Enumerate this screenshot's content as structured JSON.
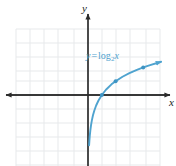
{
  "figure": {
    "width": 176,
    "height": 166,
    "background": "#ffffff",
    "y_axis_label": "y",
    "x_axis_label": "x",
    "equation": {
      "lhs": "y",
      "operator": "=",
      "function": "log",
      "base": "2",
      "argument": "x",
      "full_text": "y = log₂ x",
      "color": "#4fa3cf"
    }
  },
  "chart_data": {
    "type": "line",
    "title": "",
    "subtitle": "",
    "xlabel": "x",
    "ylabel": "y",
    "function": "y = log_2(x)",
    "annotations": [
      {
        "text": "y = log₂ x",
        "x": 5.2,
        "y": 2.7,
        "color": "#4fa3cf"
      }
    ],
    "legend": [],
    "legend_position": "none",
    "grid": true,
    "grid_color": "#e6e8ea",
    "grid_spacing_units": 1,
    "axis_color": "#2b2b2b",
    "curve_color": "#4fa3cf",
    "xlim": [
      -5.2,
      5.2
    ],
    "ylim": [
      -4.7,
      4.7
    ],
    "xticks": [
      -5,
      -4,
      -3,
      -2,
      -1,
      0,
      1,
      2,
      3,
      4,
      5
    ],
    "yticks": [
      -4,
      -3,
      -2,
      -1,
      0,
      1,
      2,
      3,
      4
    ],
    "xtick_labels": [],
    "ytick_labels": [],
    "asymptote": {
      "type": "vertical",
      "x": 0
    },
    "marked_points": [
      {
        "x": 1,
        "y": 0
      },
      {
        "x": 2,
        "y": 1
      },
      {
        "x": 4,
        "y": 2
      }
    ],
    "series": [
      {
        "name": "y = log₂ x",
        "color": "#4fa3cf",
        "x": [
          0.08,
          0.1,
          0.13,
          0.17,
          0.22,
          0.28,
          0.36,
          0.46,
          0.59,
          0.76,
          1.0,
          1.3,
          1.7,
          2.0,
          2.5,
          3.0,
          3.5,
          4.0,
          4.5,
          5.0,
          5.3
        ],
        "values": [
          -3.64,
          -3.32,
          -2.94,
          -2.56,
          -2.18,
          -1.84,
          -1.47,
          -1.12,
          -0.76,
          -0.4,
          0.0,
          0.38,
          0.77,
          1.0,
          1.32,
          1.58,
          1.81,
          2.0,
          2.17,
          2.32,
          2.41
        ]
      }
    ]
  }
}
